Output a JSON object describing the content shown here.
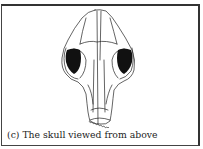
{
  "figure": {
    "label": "(c)",
    "caption": "(c) The skull viewed from above",
    "colors": {
      "ink": "#222222",
      "fill_dark": "#111111",
      "background": "#ffffff",
      "border": "#444444"
    }
  }
}
